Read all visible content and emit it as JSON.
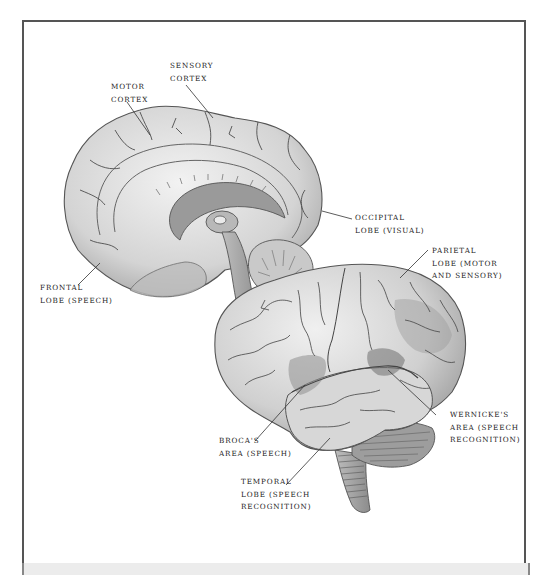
{
  "figure": {
    "type": "anatomical-illustration",
    "colors": {
      "frame_border": "#555555",
      "label_text": "#222222",
      "brain_fill": "#d9d9d9",
      "brain_shade": "#a8a8a8",
      "sulcus_line": "#555555",
      "background": "#ffffff",
      "bottom_band": "#ececec"
    }
  },
  "labels": {
    "sensory_cortex": {
      "line1": "SENSORY",
      "line2": "CORTEX"
    },
    "motor_cortex": {
      "line1": "MOTOR",
      "line2": "CORTEX"
    },
    "occipital_lobe": {
      "line1": "OCCIPITAL",
      "line2": "LOBE (VISUAL)"
    },
    "parietal_lobe": {
      "line1": "PARIETAL",
      "line2": "LOBE (MOTOR",
      "line3": "AND SENSORY)"
    },
    "frontal_lobe": {
      "line1": "FRONTAL",
      "line2": "LOBE (SPEECH)"
    },
    "wernickes_area": {
      "line1": "WERNICKE'S",
      "line2": "AREA (SPEECH",
      "line3": "RECOGNITION)"
    },
    "brocas_area": {
      "line1": "BROCA'S",
      "line2": "AREA (SPEECH)"
    },
    "temporal_lobe": {
      "line1": "TEMPORAL",
      "line2": "LOBE (SPEECH",
      "line3": "RECOGNITION)"
    }
  }
}
